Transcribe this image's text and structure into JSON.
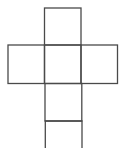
{
  "diagram": {
    "type": "cube-net-figure",
    "background": "#ffffff",
    "stroke_color": "#4a4a4a",
    "faces": [
      {
        "name": "top-face",
        "x": 44.5,
        "y": 8,
        "w": 36.5,
        "h": 37
      },
      {
        "name": "left-face",
        "x": 8,
        "y": 45,
        "w": 36.5,
        "h": 38.5
      },
      {
        "name": "center-face",
        "x": 44.5,
        "y": 45,
        "w": 36.5,
        "h": 38.5
      },
      {
        "name": "right-face",
        "x": 81,
        "y": 45,
        "w": 36.5,
        "h": 38.5
      },
      {
        "name": "lower-face",
        "x": 45,
        "y": 83.5,
        "w": 36.8,
        "h": 37.5
      }
    ],
    "open_bottom": {
      "name": "bottom-open-face",
      "top_y": 121,
      "left_x": 45.3,
      "right_x": 82,
      "bottom_y": 148
    }
  }
}
